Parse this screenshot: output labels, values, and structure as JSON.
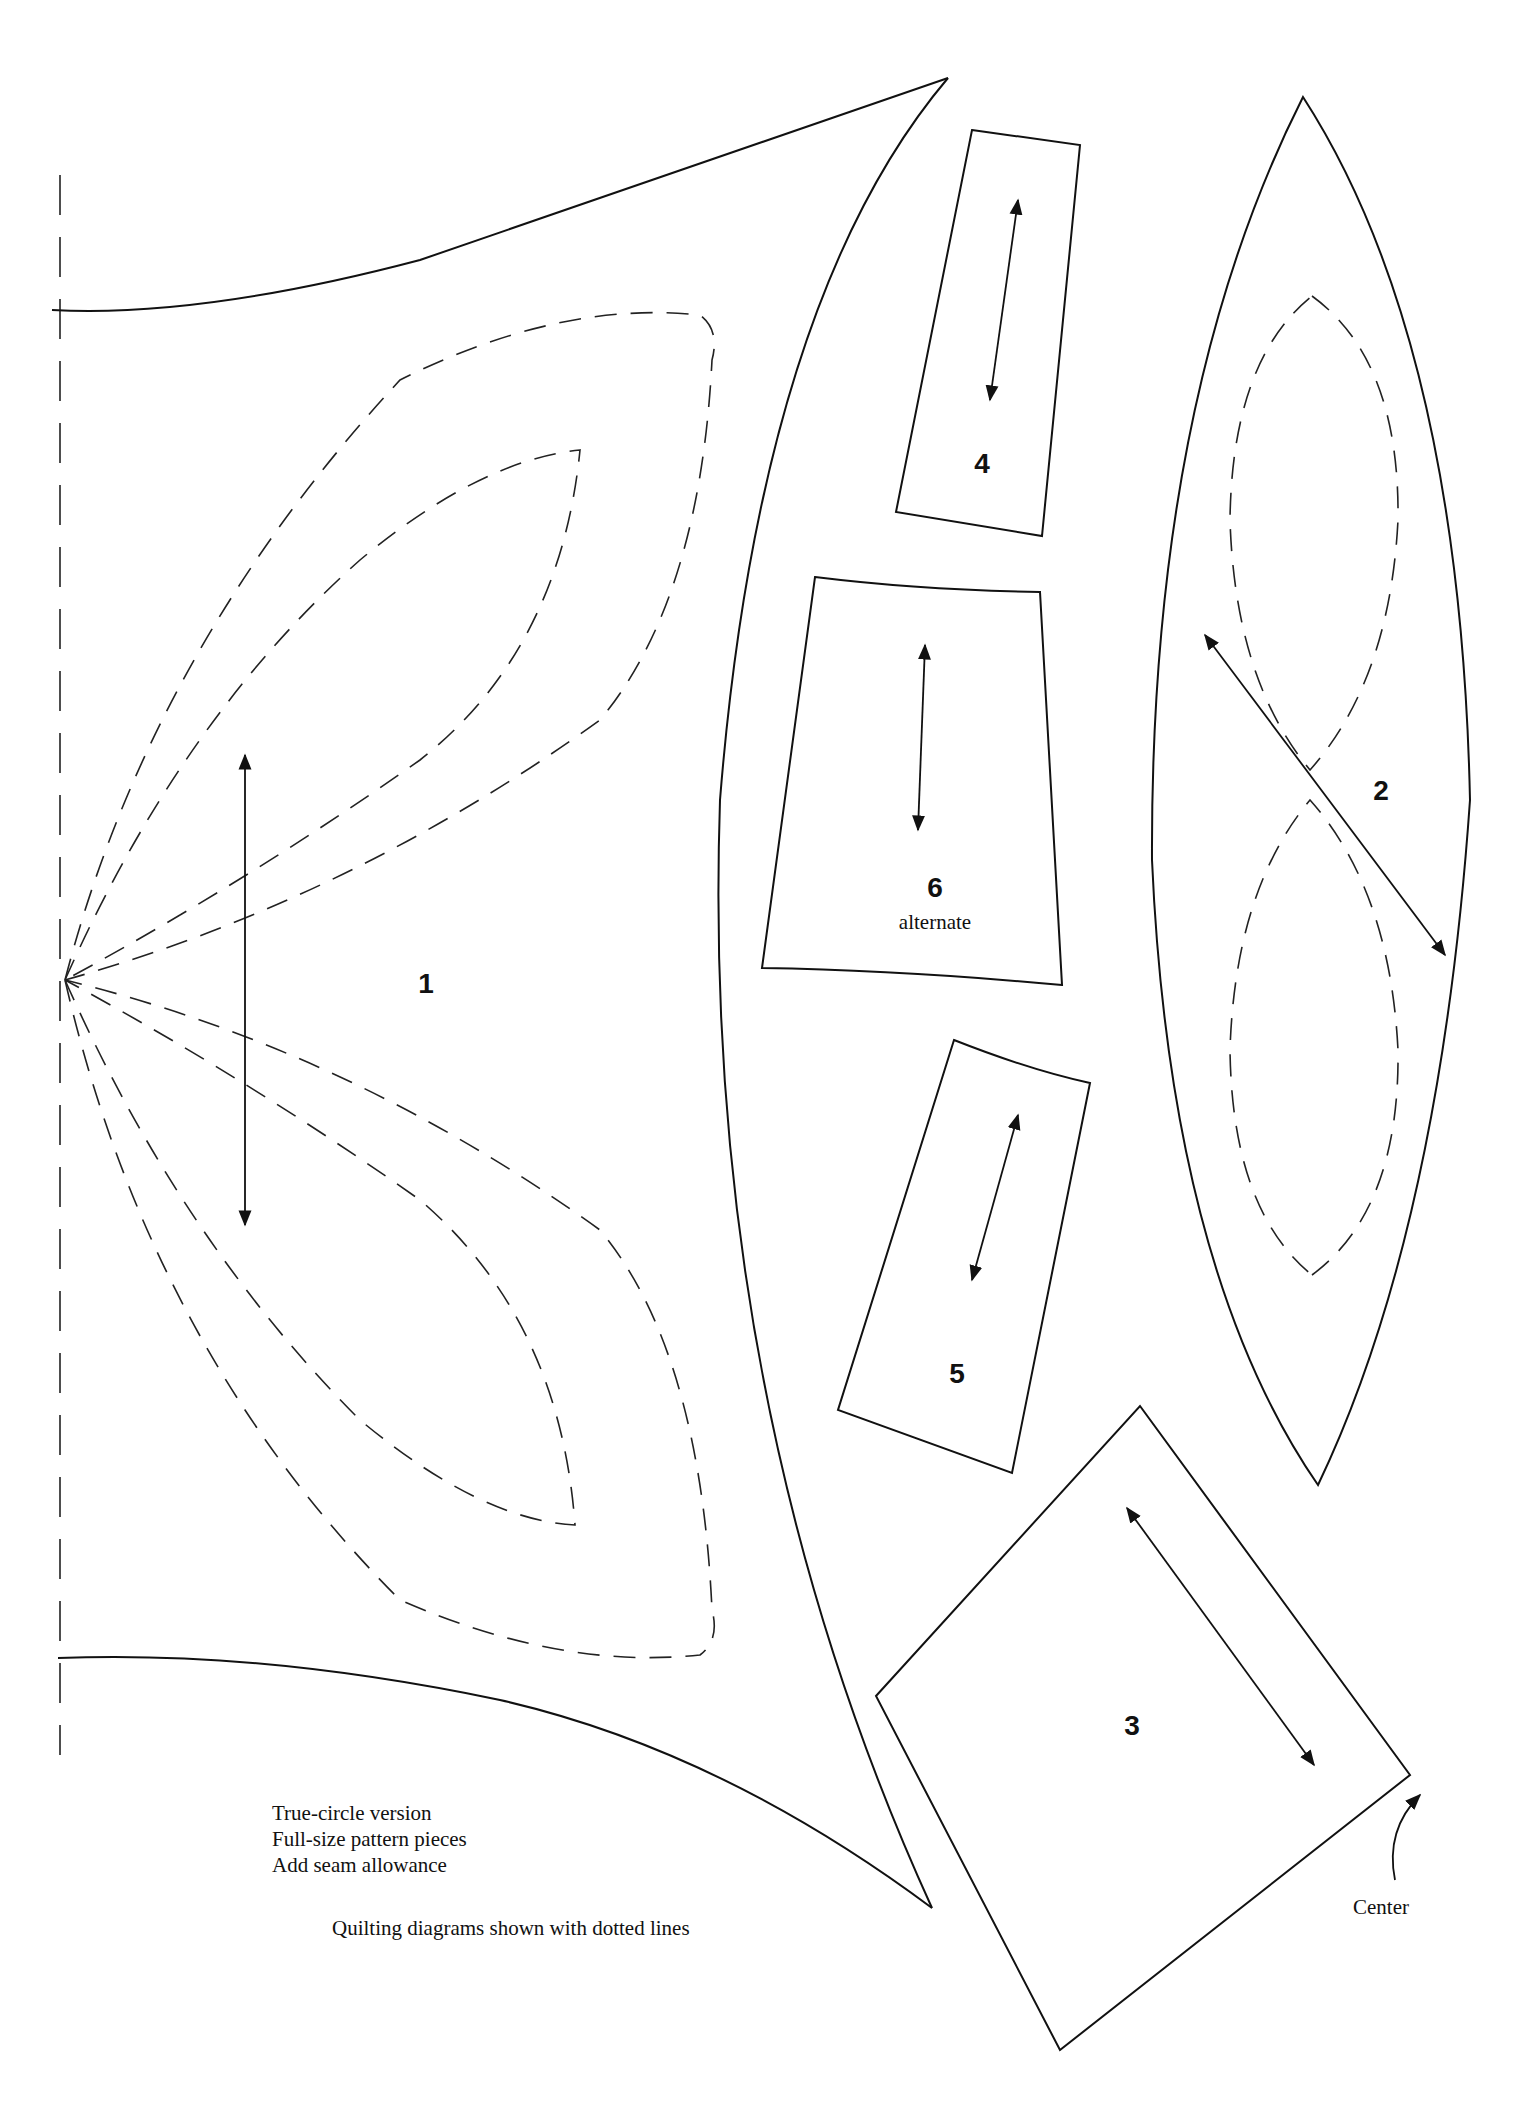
{
  "pieces": {
    "p1": "1",
    "p2": "2",
    "p3": "3",
    "p4": "4",
    "p5": "5",
    "p6": "6",
    "p6_sub": "alternate"
  },
  "notes": {
    "line1": "True-circle version",
    "line2": "Full-size pattern pieces",
    "line3": "Add seam allowance",
    "quilting": "Quilting diagrams shown with dotted lines",
    "center": "Center"
  }
}
